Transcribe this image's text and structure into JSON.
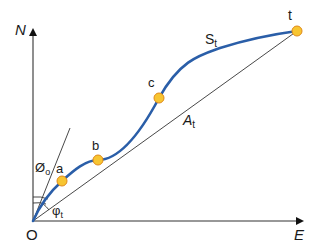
{
  "diagram": {
    "axes": {
      "y_label": "N",
      "x_label": "E",
      "origin_label": "O"
    },
    "points": [
      {
        "id": "a",
        "label": "a"
      },
      {
        "id": "b",
        "label": "b"
      },
      {
        "id": "c",
        "label": "c"
      },
      {
        "id": "t",
        "label": "t"
      }
    ],
    "curve_label": {
      "main": "S",
      "sub": "t"
    },
    "chord_label": {
      "main": "A",
      "sub": "t"
    },
    "angle_labels": {
      "phi0": {
        "main": "Ø",
        "sub": "o"
      },
      "phit": {
        "main": "φ",
        "sub": "t"
      }
    },
    "colors": {
      "curve": "#2a5ea8",
      "point_fill": "#f7c531",
      "point_stroke": "#e08a1a",
      "axis": "#222222",
      "line": "#333333"
    }
  }
}
